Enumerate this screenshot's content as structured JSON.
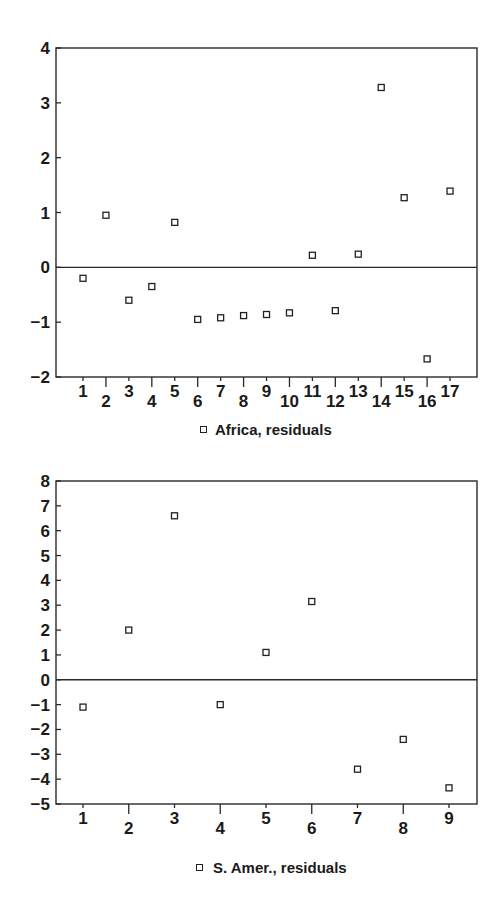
{
  "chart_data": [
    {
      "type": "scatter",
      "title": "",
      "xlabel": "",
      "ylabel": "",
      "legend": "Africa, residuals",
      "legend_position": "bottom-center",
      "marker": "open-square",
      "x": [
        1,
        2,
        3,
        4,
        5,
        6,
        7,
        8,
        9,
        10,
        11,
        12,
        13,
        14,
        15,
        16,
        17
      ],
      "y": [
        -0.2,
        0.95,
        -0.6,
        -0.35,
        0.82,
        -0.95,
        -0.92,
        -0.88,
        -0.86,
        -0.83,
        0.22,
        -0.79,
        0.24,
        3.28,
        1.27,
        -1.67,
        1.39
      ],
      "xlim": [
        0.25,
        17.6
      ],
      "ylim": [
        -2,
        4
      ],
      "yticks": [
        -2,
        -1,
        0,
        1,
        2,
        3,
        4
      ],
      "xticks": [
        1,
        2,
        3,
        4,
        5,
        6,
        7,
        8,
        9,
        10,
        11,
        12,
        13,
        14,
        15,
        16,
        17
      ],
      "zero_line": true,
      "grid": false
    },
    {
      "type": "scatter",
      "title": "",
      "xlabel": "",
      "ylabel": "",
      "legend": "S. Amer., residuals",
      "legend_position": "bottom-center",
      "marker": "open-square",
      "x": [
        1,
        2,
        3,
        4,
        5,
        6,
        7,
        8,
        9
      ],
      "y": [
        -1.1,
        2.0,
        6.6,
        -1.0,
        1.1,
        3.15,
        -3.6,
        -2.4,
        -4.35
      ],
      "xlim": [
        0.4,
        9.6
      ],
      "ylim": [
        -5,
        8
      ],
      "yticks": [
        -5,
        -4,
        -3,
        -2,
        -1,
        0,
        1,
        2,
        3,
        4,
        5,
        6,
        7,
        8
      ],
      "xticks": [
        1,
        2,
        3,
        4,
        5,
        6,
        7,
        8,
        9
      ],
      "zero_line": true,
      "grid": false
    }
  ],
  "charts": {
    "top": {
      "legend": "Africa, residuals"
    },
    "bottom": {
      "legend": "S. Amer., residuals"
    }
  }
}
